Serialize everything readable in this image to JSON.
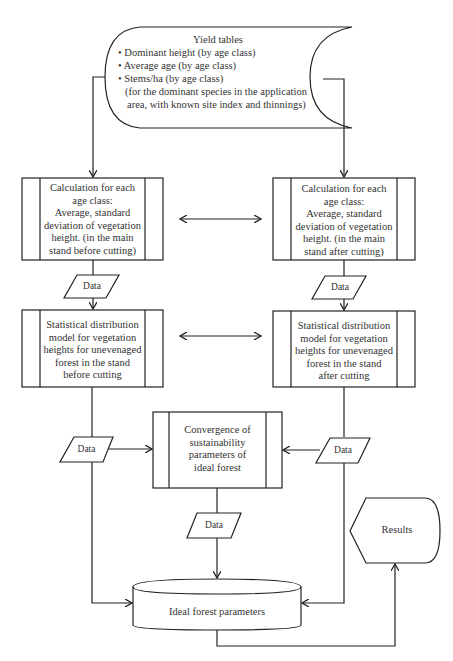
{
  "diagram": {
    "type": "flowchart",
    "yield_tables": {
      "title": "Yield tables",
      "bullets": [
        "• Dominant height (by age class)",
        "• Average age (by age class)",
        "• Stems/ha (by age class)"
      ],
      "note_lines": [
        "(for the dominant species in the application",
        "area, with known site index and thinnings)"
      ]
    },
    "calc_before": {
      "lines": [
        "Calculation for each",
        "age class:",
        "Average, standard",
        "deviation of vegetation",
        "height. (in the main",
        "stand before cutting)"
      ]
    },
    "calc_after": {
      "lines": [
        "Calculation for each",
        "age class:",
        "Average, standard",
        "deviation of vegetation",
        "height. (in the main",
        "stand after cutting)"
      ]
    },
    "stat_before": {
      "lines": [
        "Statistical distribution",
        "model for vegetation",
        "heights for unevenaged",
        "forest in the stand",
        "before cutting"
      ]
    },
    "stat_after": {
      "lines": [
        "Statistical distribution",
        "model for vegetation",
        "heights for unevenaged",
        "forest in the stand",
        "after cutting"
      ]
    },
    "convergence": {
      "lines": [
        "Convergence of",
        "sustainability",
        "parameters of",
        "ideal forest"
      ]
    },
    "data_label": "Data",
    "data_nodes": [
      "Data",
      "Data",
      "Data",
      "Data",
      "Data"
    ],
    "ideal_forest": "Ideal forest parameters",
    "results": "Results",
    "colors": {
      "stroke": "#222222",
      "background": "#ffffff",
      "text": "#333333"
    }
  }
}
